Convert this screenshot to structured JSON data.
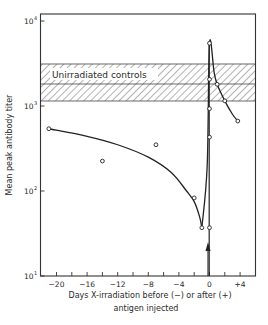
{
  "chart_data": {
    "type": "line",
    "title": "",
    "xlabel": "Days X-irradiation before (−) or after (+) antigen injected",
    "xlabel_lines": [
      "Days X-irradiation before (−) or after (+)",
      "antigen injected"
    ],
    "ylabel": "Mean peak antibody titer",
    "yscale": "log",
    "xlim": [
      -22,
      6
    ],
    "ylim": [
      10,
      10000
    ],
    "x_ticks": [
      -20,
      -18,
      -16,
      -14,
      -12,
      -10,
      -8,
      -6,
      -4,
      -2,
      0,
      2,
      4
    ],
    "x_tick_labels": [
      {
        "value": -20,
        "label": "−20"
      },
      {
        "value": -16,
        "label": "−16"
      },
      {
        "value": -12,
        "label": "−12"
      },
      {
        "value": -8,
        "label": "−8"
      },
      {
        "value": -4,
        "label": "−4"
      },
      {
        "value": 0,
        "label": "0"
      },
      {
        "value": 4,
        "label": "+4"
      }
    ],
    "y_ticks": [
      {
        "value": 10,
        "base": "10",
        "exp": "1"
      },
      {
        "value": 100,
        "base": "10",
        "exp": "2"
      },
      {
        "value": 1000,
        "base": "10",
        "exp": "3"
      },
      {
        "value": 10000,
        "base": "10",
        "exp": "4"
      }
    ],
    "grid": false,
    "series": [
      {
        "name": "Irradiated before antigen (fitted curve)",
        "x": [
          -21,
          -14,
          -7,
          -2,
          -1
        ],
        "values": [
          540,
          225,
          350,
          83,
          37
        ],
        "curve": [
          [
            -21,
            540
          ],
          [
            -16,
            440
          ],
          [
            -12,
            350
          ],
          [
            -8,
            250
          ],
          [
            -5,
            165
          ],
          [
            -3,
            100
          ],
          [
            -2,
            75
          ],
          [
            -1.3,
            50
          ],
          [
            -1,
            37
          ]
        ]
      },
      {
        "name": "Irradiated at/after antigen",
        "x": [
          0,
          0,
          0,
          0,
          0,
          1,
          2,
          3.7
        ],
        "values": [
          5470,
          2060,
          930,
          430,
          37,
          1800,
          1150,
          665
        ],
        "curve": [
          [
            -1,
            37
          ],
          [
            -0.3,
            200
          ],
          [
            0,
            5470
          ],
          [
            0.6,
            2500
          ],
          [
            1,
            1800
          ],
          [
            2,
            1150
          ],
          [
            3,
            800
          ],
          [
            3.7,
            665
          ]
        ]
      }
    ],
    "reference_band": {
      "label": "Unirradiated controls",
      "upper": 3120,
      "mean": 1815,
      "lower": 1145,
      "style": "hatched"
    },
    "annotations": [
      {
        "type": "arrow",
        "x": 0,
        "direction": "up",
        "meaning": "antigen injection (day 0)"
      }
    ]
  }
}
